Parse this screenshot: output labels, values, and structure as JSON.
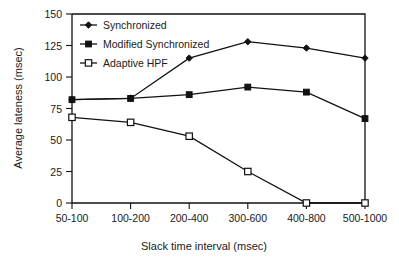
{
  "chart_data": {
    "type": "line",
    "title": "",
    "xlabel": "Slack time interval (msec)",
    "ylabel": "Average lateness (msec)",
    "categories": [
      "50-100",
      "100-200",
      "200-400",
      "300-600",
      "400-800",
      "500-1000"
    ],
    "ylim": [
      0,
      150
    ],
    "yticks": [
      0,
      25,
      50,
      75,
      100,
      125,
      150
    ],
    "ytick_labels": [
      "0",
      "25",
      "50",
      "75",
      "100",
      "125",
      "150"
    ],
    "grid": false,
    "legend_position": "top-left-inside",
    "series": [
      {
        "name": "Synchronized",
        "marker": "filled-diamond",
        "values": [
          82,
          83,
          115,
          128,
          123,
          115
        ]
      },
      {
        "name": "Modified Synchronized",
        "marker": "filled-square",
        "values": [
          82,
          83,
          86,
          92,
          88,
          67
        ]
      },
      {
        "name": "Adaptive HPF",
        "marker": "open-square",
        "values": [
          68,
          64,
          53,
          25,
          0,
          0
        ]
      }
    ]
  },
  "axes": {
    "y_title": "Average lateness (msec)",
    "x_title": "Slack time interval (msec)",
    "y_tick_labels": [
      "150",
      "125",
      "100",
      "75",
      "50",
      "25",
      "0"
    ],
    "x_tick_labels": [
      "50-100",
      "100-200",
      "200-400",
      "300-600",
      "400-800",
      "500-1000"
    ]
  },
  "legend": {
    "items": [
      {
        "label": "Synchronized",
        "marker": "filled-diamond"
      },
      {
        "label": "Modified Synchronized",
        "marker": "filled-square"
      },
      {
        "label": "Adaptive HPF",
        "marker": "open-square"
      }
    ]
  },
  "colors": {
    "line": "#111111",
    "background": "#ffffff",
    "text": "#1a1a1a"
  }
}
